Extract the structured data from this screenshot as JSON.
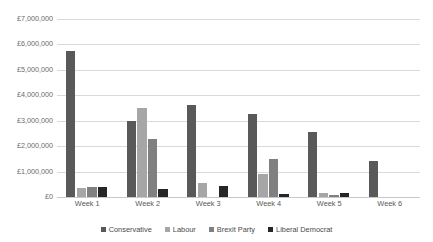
{
  "chart_data": {
    "type": "bar",
    "title": "",
    "subtitle": "",
    "xlabel": "",
    "ylabel": "",
    "categories": [
      "Week 1",
      "Week 2",
      "Week 3",
      "Week 4",
      "Week 5",
      "Week 6"
    ],
    "series": [
      {
        "name": "Conservative",
        "color": "#595959",
        "values": [
          5750000,
          3000000,
          3600000,
          3250000,
          2550000,
          1400000
        ]
      },
      {
        "name": "Labour",
        "color": "#a6a6a6",
        "values": [
          350000,
          3500000,
          550000,
          900000,
          150000,
          0
        ]
      },
      {
        "name": "Brexit Party",
        "color": "#808080",
        "values": [
          400000,
          2300000,
          0,
          1500000,
          80000,
          0
        ]
      },
      {
        "name": "Liberal Democrat",
        "color": "#262626",
        "values": [
          400000,
          300000,
          450000,
          100000,
          150000,
          0
        ]
      }
    ],
    "ylim": [
      0,
      7000000
    ],
    "ytick_values": [
      0,
      1000000,
      2000000,
      3000000,
      4000000,
      5000000,
      6000000,
      7000000
    ],
    "ytick_labels": [
      "£0",
      "£1,000,000",
      "£2,000,000",
      "£3,000,000",
      "£4,000,000",
      "£5,000,000",
      "£6,000,000",
      "£7,000,000"
    ],
    "grid": true,
    "grid_axis": "y",
    "legend_position": "bottom",
    "currency_symbol": "£",
    "background_color": "#ffffff",
    "gridline_color": "#d9d9d9"
  }
}
